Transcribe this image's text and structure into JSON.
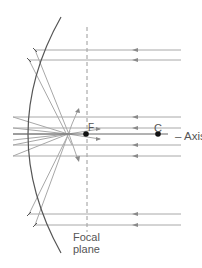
{
  "labels": {
    "focus": "F",
    "center": "C",
    "axis": "– Axis",
    "focal_plane_line1": "Focal",
    "focal_plane_line2": "plane"
  },
  "colors": {
    "mirror": "#555555",
    "ray": "#a8a8a8",
    "focal_plane": "#9a9a9a",
    "point": "#111111"
  },
  "diagram": {
    "type": "concave-mirror-ray-diagram",
    "axis_y": 134,
    "focus_point": [
      86,
      134
    ],
    "center_point": [
      158,
      134
    ],
    "focal_plane_x": 87,
    "incoming_rays_y": [
      50,
      60,
      117,
      128,
      145,
      156,
      214,
      225
    ]
  }
}
